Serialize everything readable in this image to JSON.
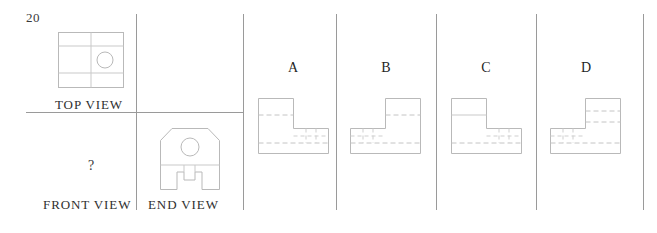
{
  "question": {
    "number": "20",
    "missing_view_marker": "?"
  },
  "problem_panel": {
    "labels": {
      "top_view": "TOP VIEW",
      "front_view": "FRONT VIEW",
      "end_view": "END VIEW"
    },
    "given_views": [
      {
        "name": "top-view",
        "description": "rectangle with vertical center line, two horizontal division lines and a circular hole"
      },
      {
        "name": "end-view",
        "description": "block with chamfered upper corners, circular hole and rectangular notch at bottom center"
      }
    ],
    "missing_view": "front-view"
  },
  "options": [
    {
      "letter": "A",
      "name": "option-a",
      "description": "L-shaped front view, tall block at left, hidden lines dashed across upper block"
    },
    {
      "letter": "B",
      "name": "option-b",
      "description": "L-shaped front view mirrored, tall block at right"
    },
    {
      "letter": "C",
      "name": "option-c",
      "description": "L-shaped front view, tall block at left with solid division lines"
    },
    {
      "letter": "D",
      "name": "option-d",
      "description": "L-shaped front view mirrored, tall block at right with dashed division lines"
    }
  ],
  "colors": {
    "line": "#b9b9b9",
    "hidden_line": "#c4c4c4",
    "divider": "#9a9a9a",
    "text": "#2b2b2b",
    "background": "#ffffff"
  }
}
